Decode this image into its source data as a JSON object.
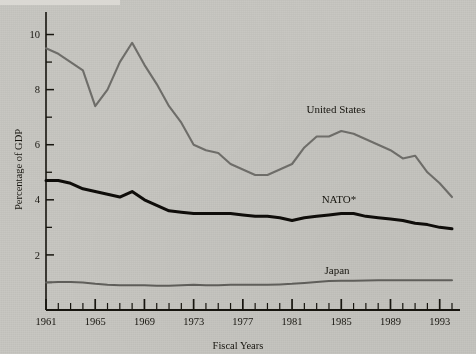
{
  "figure": {
    "background_color": "#c8c7c2",
    "ink_color": "#17150f"
  },
  "axes": {
    "y_title": "Percentage of GDP",
    "x_title": "Fiscal Years",
    "y_ticks": [
      "2",
      "4",
      "6",
      "8",
      "10"
    ],
    "x_ticks": [
      "1961",
      "1965",
      "1969",
      "1973",
      "1977",
      "1981",
      "1985",
      "1989",
      "1993"
    ]
  },
  "labels": {
    "united_states": "United States",
    "nato": "NATO*",
    "japan": "Japan"
  },
  "chart_data": {
    "type": "line",
    "title": "",
    "xlabel": "Fiscal Years",
    "ylabel": "Percentage of GDP",
    "xlim": [
      1961,
      1994
    ],
    "ylim": [
      0,
      10.6
    ],
    "grid": false,
    "legend": "inline-annotations",
    "x": [
      1961,
      1962,
      1963,
      1964,
      1965,
      1966,
      1967,
      1968,
      1969,
      1970,
      1971,
      1972,
      1973,
      1974,
      1975,
      1976,
      1977,
      1978,
      1979,
      1980,
      1981,
      1982,
      1983,
      1984,
      1985,
      1986,
      1987,
      1988,
      1989,
      1990,
      1991,
      1992,
      1993,
      1994
    ],
    "series": [
      {
        "name": "United States",
        "color": "#6e6d69",
        "stroke_width": 2.1,
        "values": [
          9.5,
          9.3,
          9.0,
          8.7,
          7.4,
          8.0,
          9.0,
          9.7,
          8.9,
          8.2,
          7.4,
          6.8,
          6.0,
          5.8,
          5.7,
          5.3,
          5.1,
          4.9,
          4.9,
          5.1,
          5.3,
          5.9,
          6.3,
          6.3,
          6.5,
          6.4,
          6.2,
          6.0,
          5.8,
          5.5,
          5.6,
          5.0,
          4.6,
          4.1
        ]
      },
      {
        "name": "NATO*",
        "color": "#0f0d0a",
        "stroke_width": 3.0,
        "values": [
          4.7,
          4.7,
          4.6,
          4.4,
          4.3,
          4.2,
          4.1,
          4.3,
          4.0,
          3.8,
          3.6,
          3.55,
          3.5,
          3.5,
          3.5,
          3.5,
          3.45,
          3.4,
          3.4,
          3.35,
          3.25,
          3.35,
          3.4,
          3.45,
          3.5,
          3.5,
          3.4,
          3.35,
          3.3,
          3.25,
          3.15,
          3.1,
          3.0,
          2.95
        ]
      },
      {
        "name": "Japan",
        "color": "#5f5e5a",
        "stroke_width": 2.0,
        "values": [
          1.0,
          1.02,
          1.02,
          1.0,
          0.95,
          0.92,
          0.9,
          0.9,
          0.9,
          0.88,
          0.88,
          0.9,
          0.92,
          0.9,
          0.9,
          0.92,
          0.92,
          0.92,
          0.92,
          0.93,
          0.95,
          0.98,
          1.02,
          1.05,
          1.06,
          1.06,
          1.07,
          1.08,
          1.08,
          1.08,
          1.08,
          1.08,
          1.08,
          1.08
        ]
      }
    ]
  }
}
